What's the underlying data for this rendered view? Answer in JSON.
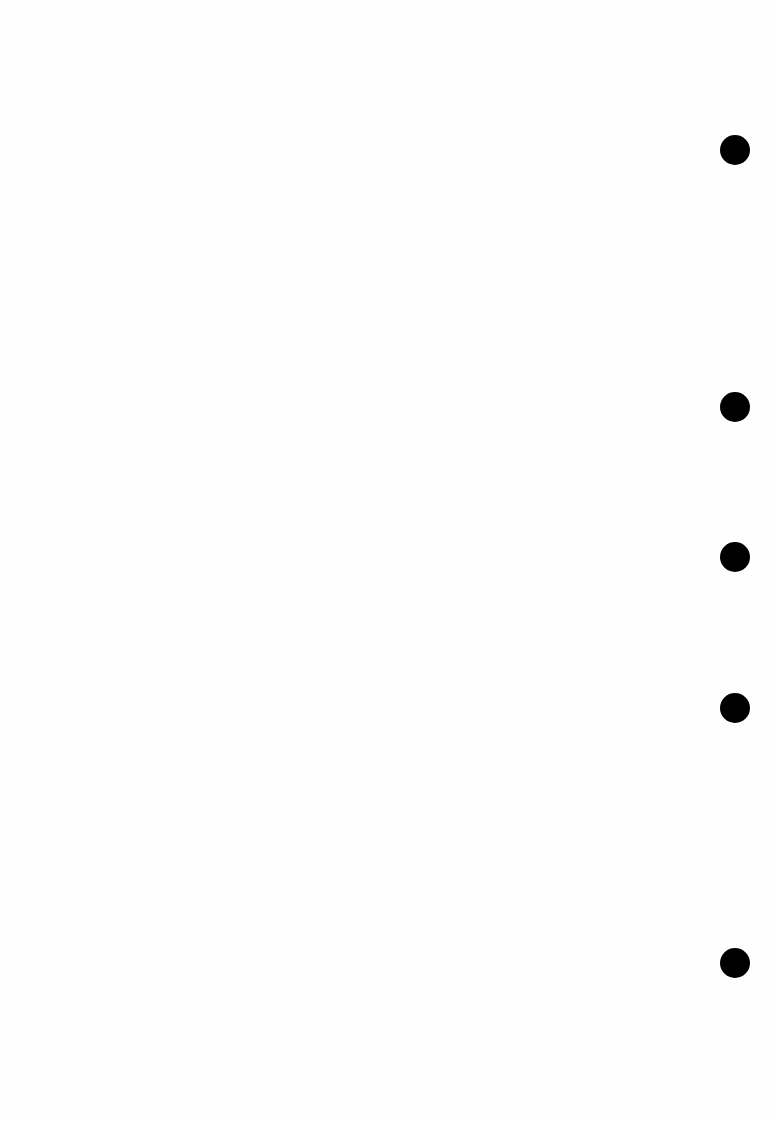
{
  "page": {
    "background": "#fefefe",
    "punch_holes": [
      {
        "x": 735,
        "y": 150
      },
      {
        "x": 735,
        "y": 407
      },
      {
        "x": 735,
        "y": 557
      },
      {
        "x": 735,
        "y": 708
      },
      {
        "x": 735,
        "y": 963
      }
    ],
    "hole_color": "#000000"
  }
}
